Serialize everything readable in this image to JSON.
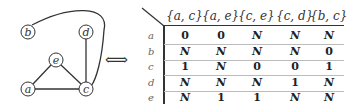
{
  "graph": {
    "nodes": [
      {
        "id": "a",
        "label": "a",
        "x": 28,
        "y": 89
      },
      {
        "id": "b",
        "label": "b",
        "x": 28,
        "y": 32
      },
      {
        "id": "c",
        "label": "c",
        "x": 86,
        "y": 89
      },
      {
        "id": "d",
        "label": "d",
        "x": 86,
        "y": 32
      },
      {
        "id": "e",
        "label": "e",
        "x": 56,
        "y": 60
      }
    ],
    "edges": [
      [
        "a",
        "c"
      ],
      [
        "a",
        "e"
      ],
      [
        "c",
        "e"
      ],
      [
        "c",
        "d"
      ],
      [
        "b",
        "c"
      ]
    ]
  },
  "arrow": "⟺",
  "table": {
    "columns": [
      "{a, c}",
      "{a, e}",
      "{c, e}",
      "{c, d}",
      "{b, c}"
    ],
    "rows": [
      {
        "label": "a",
        "values": [
          "0",
          "0",
          "N",
          "N",
          "N"
        ]
      },
      {
        "label": "b",
        "values": [
          "N",
          "N",
          "N",
          "N",
          "0"
        ]
      },
      {
        "label": "c",
        "values": [
          "1",
          "N",
          "0",
          "0",
          "1"
        ]
      },
      {
        "label": "d",
        "values": [
          "N",
          "N",
          "N",
          "1",
          "N"
        ]
      },
      {
        "label": "e",
        "values": [
          "N",
          "1",
          "1",
          "N",
          "N"
        ]
      }
    ]
  }
}
